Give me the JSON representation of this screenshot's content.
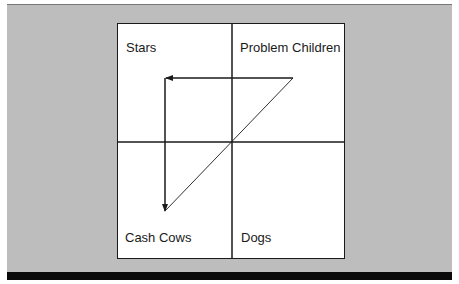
{
  "diagram": {
    "type": "growth-share-matrix",
    "quadrants": {
      "top_left": "Stars",
      "top_right": "Problem Children",
      "bottom_left": "Cash Cows",
      "bottom_right": "Dogs"
    },
    "arrows": [
      {
        "from": "Problem Children",
        "to": "Stars",
        "style": "solid-arrow"
      },
      {
        "from": "Stars",
        "to": "Cash Cows",
        "style": "solid-arrow"
      },
      {
        "from": "Cash Cows",
        "to": "Problem Children",
        "style": "thin-line"
      }
    ],
    "colors": {
      "background_panel": "#bdbdbd",
      "matrix_fill": "#ffffff",
      "lines": "#1a1a1a",
      "bottom_bar": "#0a0a0a"
    }
  }
}
